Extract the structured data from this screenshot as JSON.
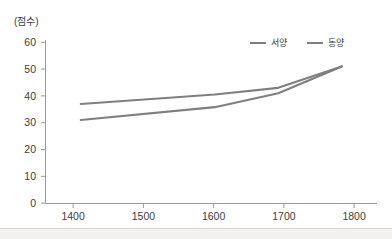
{
  "figure": {
    "background_color": "#ffffff",
    "axis_color": "#9b9b9b",
    "text_color": "#3d3d3d",
    "series_color": "#7f7f7f"
  },
  "axis_unit": {
    "label": "(점수)"
  },
  "legend": {
    "position": "top-right",
    "entries": [
      {
        "label": "서양",
        "color": "#7f7f7f"
      },
      {
        "label": "동양",
        "color": "#7f7f7f"
      }
    ]
  },
  "chart_data": {
    "type": "line",
    "title": "",
    "subtitle": "",
    "xlabel": "",
    "ylabel": "(점수)",
    "xlim": [
      1360,
      1830
    ],
    "ylim": [
      0,
      60
    ],
    "grid": false,
    "legend_position": "top-right",
    "xticks": [
      1400,
      1500,
      1600,
      1700,
      1800
    ],
    "xtick_labels": [
      "1400",
      "1500",
      "1600",
      "1700",
      "1800"
    ],
    "yticks": [
      0,
      10,
      20,
      30,
      40,
      50,
      60
    ],
    "ytick_labels": [
      "0",
      "10",
      "20",
      "30",
      "40",
      "50",
      "60"
    ],
    "series": [
      {
        "name": "서양",
        "color": "#7f7f7f",
        "x": [
          1410,
          1600,
          1690,
          1780
        ],
        "values": [
          37,
          40.5,
          43,
          51
        ]
      },
      {
        "name": "동양",
        "color": "#7f7f7f",
        "x": [
          1410,
          1600,
          1690,
          1780
        ],
        "values": [
          31,
          35.8,
          41,
          51
        ]
      }
    ]
  }
}
